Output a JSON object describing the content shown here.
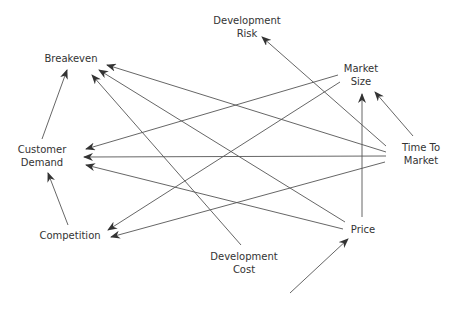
{
  "diagram": {
    "type": "causal-influence-diagram",
    "line_color": "#555555",
    "text_color": "#333333",
    "nodes": [
      {
        "id": "development_risk",
        "lines": [
          "Development",
          "Risk"
        ],
        "x": 247,
        "y": 14
      },
      {
        "id": "breakeven",
        "lines": [
          "Breakeven"
        ],
        "x": 71,
        "y": 52
      },
      {
        "id": "market_size",
        "lines": [
          "Market",
          "Size"
        ],
        "x": 361,
        "y": 62
      },
      {
        "id": "customer_demand",
        "lines": [
          "Customer",
          "Demand"
        ],
        "x": 42,
        "y": 143
      },
      {
        "id": "time_to_market",
        "lines": [
          "Time To",
          "Market"
        ],
        "x": 421,
        "y": 141
      },
      {
        "id": "competition",
        "lines": [
          "Competition"
        ],
        "x": 70,
        "y": 229
      },
      {
        "id": "price",
        "lines": [
          "Price"
        ],
        "x": 363,
        "y": 223
      },
      {
        "id": "development_cost",
        "lines": [
          "Development",
          "Cost"
        ],
        "x": 244,
        "y": 250
      }
    ],
    "edges": [
      {
        "from": "customer_demand",
        "to": "breakeven",
        "x1": 42,
        "y1": 139,
        "x2": 67,
        "y2": 70
      },
      {
        "from": "competition",
        "to": "customer_demand",
        "x1": 68,
        "y1": 225,
        "x2": 48,
        "y2": 173
      },
      {
        "from": "time_to_market",
        "to": "development_risk",
        "x1": 386,
        "y1": 146,
        "x2": 262,
        "y2": 37
      },
      {
        "from": "time_to_market",
        "to": "market_size",
        "x1": 413,
        "y1": 136,
        "x2": 375,
        "y2": 92
      },
      {
        "from": "price",
        "to": "market_size",
        "x1": 362,
        "y1": 217,
        "x2": 362,
        "y2": 94
      },
      {
        "from": "time_to_market",
        "to": "breakeven",
        "x1": 386,
        "y1": 152,
        "x2": 107,
        "y2": 65
      },
      {
        "from": "price",
        "to": "breakeven",
        "x1": 345,
        "y1": 222,
        "x2": 99,
        "y2": 70
      },
      {
        "from": "development_cost",
        "to": "breakeven",
        "x1": 241,
        "y1": 245,
        "x2": 92,
        "y2": 75
      },
      {
        "from": "market_size",
        "to": "customer_demand",
        "x1": 338,
        "y1": 75,
        "x2": 86,
        "y2": 149
      },
      {
        "from": "time_to_market",
        "to": "customer_demand",
        "x1": 386,
        "y1": 156,
        "x2": 84,
        "y2": 157
      },
      {
        "from": "price",
        "to": "customer_demand",
        "x1": 343,
        "y1": 229,
        "x2": 86,
        "y2": 165
      },
      {
        "from": "market_size",
        "to": "competition",
        "x1": 340,
        "y1": 82,
        "x2": 108,
        "y2": 230
      },
      {
        "from": "time_to_market",
        "to": "competition",
        "x1": 385,
        "y1": 162,
        "x2": 111,
        "y2": 237
      },
      {
        "from": "development_cost",
        "to": "price",
        "x1": 290,
        "y1": 293,
        "x2": 348,
        "y2": 239
      }
    ]
  }
}
